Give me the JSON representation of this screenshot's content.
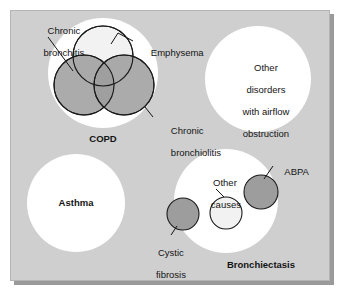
{
  "figure": {
    "type": "venn-euler-diagram",
    "panel_background": "#cfcfcf",
    "shadow_color": "#9a9a9a",
    "set_fill_white": "#ffffff",
    "fill_dark_gray": "#9d9d9d",
    "fill_light": "#f2f2f2",
    "stroke": "#1a1a1a"
  },
  "groups": {
    "copd": {
      "label": "COPD",
      "bold": true,
      "subsets": [
        {
          "key": "chronic_bronchitis",
          "label": "Chronic\nbronchitis",
          "label_line1": "Chronic",
          "label_line2": "bronchitis",
          "fill": "#9d9d9d",
          "position": "lower-left"
        },
        {
          "key": "emphysema",
          "label": "Emphysema",
          "label_line1": "Emphysema",
          "label_line2": "",
          "fill": "#f2f2f2",
          "position": "top"
        },
        {
          "key": "chronic_bronchiolitis",
          "label": "Chronic\nbronchiolitis",
          "label_line1": "Chronic",
          "label_line2": "bronchiolitis",
          "fill": "#9d9d9d",
          "position": "lower-right"
        }
      ]
    },
    "other_disorders": {
      "label_line1": "Other",
      "label_line2": "disorders",
      "label_line3": "with airflow",
      "label_line4": "obstruction",
      "fill": "#ffffff",
      "bold": false
    },
    "asthma": {
      "label": "Asthma",
      "bold": true,
      "fill": "#ffffff"
    },
    "bronchiectasis": {
      "label": "Bronchiectasis",
      "bold": true,
      "fill": "#ffffff",
      "subsets": [
        {
          "key": "cystic_fibrosis",
          "label_line1": "Cystic",
          "label_line2": "fibrosis",
          "fill": "#9d9d9d",
          "position": "left-edge"
        },
        {
          "key": "other_causes",
          "label_line1": "Other",
          "label_line2": "causes",
          "fill": "#f2f2f2",
          "position": "center"
        },
        {
          "key": "abpa",
          "label_line1": "ABPA",
          "label_line2": "",
          "fill": "#9d9d9d",
          "position": "upper-right-edge"
        }
      ]
    }
  }
}
